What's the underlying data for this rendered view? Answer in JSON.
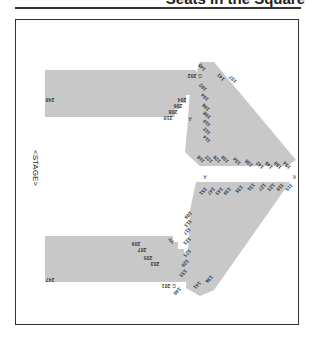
{
  "header": {
    "title": "Seats in the Square"
  },
  "map": {
    "stage_label": "<STAGE>",
    "colors": {
      "section_fill": "#c8c8c8",
      "border": "#333333",
      "text": "#333333"
    },
    "upper_block": {
      "outer_label": "248",
      "edge_labels": [
        "202",
        "204",
        "206",
        "208",
        "210"
      ],
      "row_letters": [
        "G",
        "A"
      ]
    },
    "lower_block": {
      "outer_label": "247",
      "edge_labels": [
        "209",
        "207",
        "205",
        "203",
        "201"
      ],
      "row_letters": [
        "A",
        "G"
      ]
    },
    "upper_wedge": {
      "labels_inner": [
        "102",
        "104",
        "106",
        "108",
        "110",
        "112",
        "114"
      ],
      "labels_outer": [
        "145",
        "141",
        "137"
      ],
      "labels_tip": [
        "118",
        "122",
        "126",
        "130",
        "134",
        "138",
        "142",
        "146",
        "150",
        "154"
      ],
      "row_letters": [
        "G",
        "A",
        "K"
      ]
    },
    "lower_wedge": {
      "labels_inner": [
        "109",
        "113",
        "117",
        "121",
        "125",
        "129",
        "133"
      ],
      "labels_outer": [
        "140",
        "141",
        "136"
      ],
      "labels_tip": [
        "151",
        "147",
        "143",
        "139",
        "135",
        "131",
        "127",
        "123",
        "119",
        "115"
      ],
      "row_letters": [
        "A",
        "G"
      ]
    },
    "center_letters": [
      "A",
      "K"
    ]
  }
}
